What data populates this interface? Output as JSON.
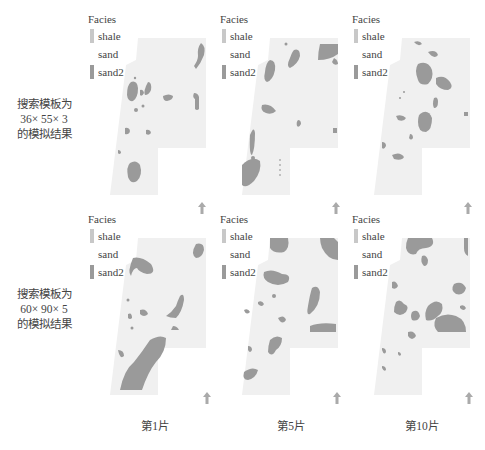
{
  "colors": {
    "shale": "#c8c8c8",
    "sand": "#f0f0f0",
    "sand2": "#9a9a9a",
    "text": "#444444"
  },
  "legend": {
    "title": "Facies",
    "items": [
      {
        "label": "shale",
        "color": "#c8c8c8"
      },
      {
        "label": "sand",
        "color": "#ffffff"
      },
      {
        "label": "sand2",
        "color": "#9a9a9a"
      }
    ]
  },
  "rows": [
    {
      "label_line1": "搜索模板为",
      "label_line2": "36× 55× 3",
      "label_line3": "的模拟结果"
    },
    {
      "label_line1": "搜索模板为",
      "label_line2": "60× 90× 5",
      "label_line3": "的模拟结果"
    }
  ],
  "columns": [
    {
      "label": "第1片"
    },
    {
      "label": "第5片"
    },
    {
      "label": "第10片"
    }
  ],
  "north_arrow": "north-arrow"
}
